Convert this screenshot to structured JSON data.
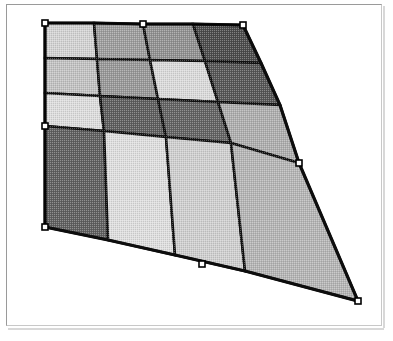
{
  "app": {
    "window_title": "",
    "canvas_background": "#ffffff",
    "frame_border_color": "#9a9a9a"
  },
  "selection": {
    "label": "mesh-selection",
    "handle_count": 8,
    "handle_fill": "#ffffff",
    "handle_stroke": "#000000",
    "handle_size": 6,
    "handles": [
      {
        "name": "handle-top-left",
        "x": 45,
        "y": 23
      },
      {
        "name": "handle-top-center",
        "x": 143,
        "y": 24
      },
      {
        "name": "handle-top-right",
        "x": 243,
        "y": 25
      },
      {
        "name": "handle-middle-right",
        "x": 299,
        "y": 163
      },
      {
        "name": "handle-bottom-right",
        "x": 358,
        "y": 301
      },
      {
        "name": "handle-bottom-center",
        "x": 202,
        "y": 264
      },
      {
        "name": "handle-bottom-left",
        "x": 45,
        "y": 227
      },
      {
        "name": "handle-middle-left",
        "x": 45,
        "y": 126
      }
    ]
  },
  "chart_data": {
    "type": "heatmap",
    "title": "",
    "subtitle": "",
    "xlabel": "",
    "ylabel": "",
    "rows": 4,
    "cols": 4,
    "grid": true,
    "legend": "none",
    "corners": {
      "top_left": {
        "x": 45,
        "y": 23
      },
      "top_right": {
        "x": 243,
        "y": 25
      },
      "bottom_right": {
        "x": 358,
        "y": 301
      },
      "bottom_left": {
        "x": 45,
        "y": 227
      }
    },
    "row_labels": [
      "r1",
      "r2",
      "r3",
      "r4"
    ],
    "col_labels": [
      "c1",
      "c2",
      "c3",
      "c4"
    ],
    "values": [
      [
        0.82,
        0.58,
        0.52,
        0.24
      ],
      [
        0.74,
        0.55,
        0.86,
        0.3
      ],
      [
        0.9,
        0.33,
        0.36,
        0.66
      ],
      [
        0.34,
        0.88,
        0.8,
        0.7
      ]
    ],
    "colors": [
      [
        "#d2d2d2",
        "#9d9d9d",
        "#919191",
        "#4c4c4c"
      ],
      [
        "#c2c2c2",
        "#989898",
        "#dadada",
        "#565656"
      ],
      [
        "#dcdcdc",
        "#5e5e5e",
        "#636363",
        "#aeaeae"
      ],
      [
        "#606060",
        "#dedede",
        "#cfcfcf",
        "#b5b5b5"
      ]
    ],
    "vertex_grid": [
      [
        {
          "x": 45,
          "y": 23
        },
        {
          "x": 94,
          "y": 23
        },
        {
          "x": 143,
          "y": 24
        },
        {
          "x": 193,
          "y": 24
        },
        {
          "x": 243,
          "y": 25
        }
      ],
      [
        {
          "x": 45,
          "y": 58
        },
        {
          "x": 97,
          "y": 59
        },
        {
          "x": 150,
          "y": 60
        },
        {
          "x": 205,
          "y": 61
        },
        {
          "x": 261,
          "y": 63
        }
      ],
      [
        {
          "x": 45,
          "y": 93
        },
        {
          "x": 100,
          "y": 96
        },
        {
          "x": 158,
          "y": 99
        },
        {
          "x": 218,
          "y": 102
        },
        {
          "x": 280,
          "y": 105
        }
      ],
      [
        {
          "x": 45,
          "y": 126
        },
        {
          "x": 104,
          "y": 131
        },
        {
          "x": 166,
          "y": 137
        },
        {
          "x": 231,
          "y": 143
        },
        {
          "x": 299,
          "y": 163
        }
      ],
      [
        {
          "x": 45,
          "y": 227
        },
        {
          "x": 108,
          "y": 240
        },
        {
          "x": 175,
          "y": 255
        },
        {
          "x": 245,
          "y": 271
        },
        {
          "x": 358,
          "y": 301
        }
      ]
    ],
    "colorscale": {
      "min_color": "#4c4c4c",
      "max_color": "#dedede",
      "min": 0.24,
      "max": 0.9
    }
  }
}
